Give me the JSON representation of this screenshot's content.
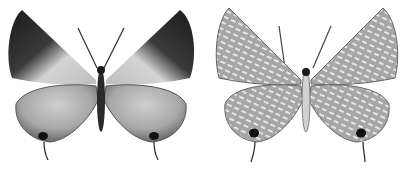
{
  "image": {
    "description": "Two grayscale butterfly specimens side by side",
    "background": "#ffffff",
    "specimens": [
      {
        "view": "upperside",
        "forewing_dark": "#1e1e1e",
        "forewing_light": "#cfcfcf",
        "hindwing_base": "#8a8a8a",
        "hindwing_light": "#c4c4c4",
        "eyespot": "#111111"
      },
      {
        "view": "underside",
        "wing_base": "#a6a6a6",
        "stripe": "#e6e6e6",
        "eyespot": "#111111"
      }
    ]
  }
}
